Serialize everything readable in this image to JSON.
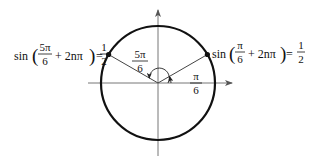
{
  "diagram": {
    "type": "unit-circle",
    "center": [
      158,
      83
    ],
    "radius": 57,
    "axes": {
      "x_range": [
        88,
        233
      ],
      "y_range": [
        10,
        156
      ],
      "arrows": [
        "right",
        "up"
      ]
    },
    "angles": [
      {
        "id": "pi-over-6",
        "num": "π",
        "den": "6",
        "degrees": 30
      },
      {
        "id": "5pi-over-6",
        "num": "5π",
        "den": "6",
        "degrees": 150
      }
    ],
    "points": [
      {
        "id": "left-point",
        "angle_deg": 150
      },
      {
        "id": "right-point",
        "angle_deg": 30
      }
    ]
  },
  "labels": {
    "left_equation": {
      "func": "sin",
      "frac_num": "5π",
      "frac_den": "6",
      "term": "+ 2nπ",
      "equals": "=",
      "rhs_num": "1",
      "rhs_den": "2"
    },
    "right_equation": {
      "func": "sin",
      "frac_num": "π",
      "frac_den": "6",
      "term": "+ 2nπ",
      "equals": "=",
      "rhs_num": "1",
      "rhs_den": "2"
    },
    "angle_5pi_6": {
      "num": "5π",
      "den": "6"
    },
    "angle_pi_6": {
      "num": "π",
      "den": "6"
    }
  }
}
